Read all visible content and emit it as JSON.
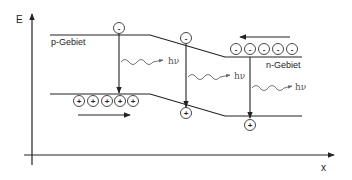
{
  "diagram": {
    "axes": {
      "y_label": "E",
      "x_label": "x"
    },
    "regions": {
      "p_label": "p-Gebiet",
      "n_label": "n-Gebiet"
    },
    "photon_label": "hν",
    "photons": [
      {
        "label": "hν"
      },
      {
        "label": "hν"
      },
      {
        "label": "hν"
      }
    ],
    "electron_sign": "-",
    "hole_sign": "+",
    "electrons": {
      "n_region_count": 5,
      "transit_count": 2
    },
    "holes": {
      "p_region_count": 5,
      "transit_count": 2
    },
    "colors": {
      "line": "#222222",
      "photon": "#666666",
      "background": "#ffffff"
    }
  }
}
